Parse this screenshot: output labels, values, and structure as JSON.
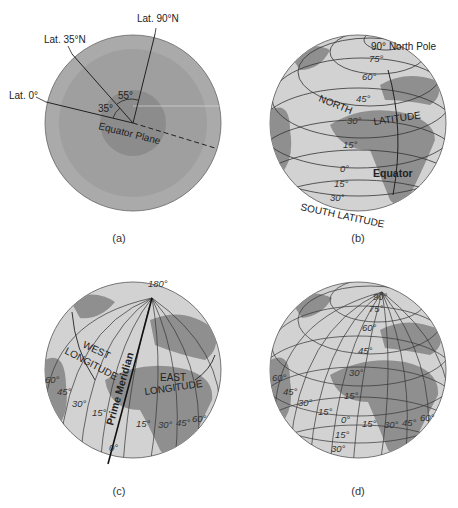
{
  "panels": {
    "a": {
      "caption": "(a)",
      "labels": {
        "lat90": "Lat. 90°N",
        "lat35": "Lat. 35°N",
        "lat0": "Lat. 0°",
        "angle55": "55°",
        "angle35": "35°",
        "equator_plane": "Equator Plane"
      }
    },
    "b": {
      "caption": "(b)",
      "labels": {
        "north_pole": "90° North Pole",
        "north": "NORTH",
        "latitude": "LATITUDE",
        "equator": "Equator",
        "south_latitude": "SOUTH LATITUDE"
      },
      "latitudes": [
        "75°",
        "60°",
        "45°",
        "30°",
        "15°",
        "0°",
        "15°",
        "30°"
      ]
    },
    "c": {
      "caption": "(c)",
      "labels": {
        "deg180": "180°",
        "west": "WEST",
        "west_longitude": "LONGITUDE",
        "east": "EAST",
        "east_longitude": "LONGITUDE",
        "prime_meridian": "Prime Meridian",
        "deg0": "0°"
      },
      "west_longitudes": [
        "60°",
        "45°",
        "30°",
        "15°"
      ],
      "east_longitudes": [
        "15°",
        "30°",
        "45°",
        "60°"
      ]
    },
    "d": {
      "caption": "(d)",
      "north_labels": [
        "90°",
        "75°",
        "60°",
        "45°",
        "30°",
        "15°"
      ],
      "equator_row": [
        "60°",
        "45°",
        "30°",
        "15°",
        "0°",
        "15°",
        "30°",
        "45°",
        "60°"
      ],
      "south_labels": [
        "15°",
        "30°"
      ]
    }
  },
  "colors": {
    "globe_outer": "#a9a9a9",
    "globe_mid": "#9c9c9c",
    "globe_core": "#8a8a8a",
    "ocean": "#d4d4d4",
    "land": "#8f8f8f",
    "lines": "#333333"
  }
}
